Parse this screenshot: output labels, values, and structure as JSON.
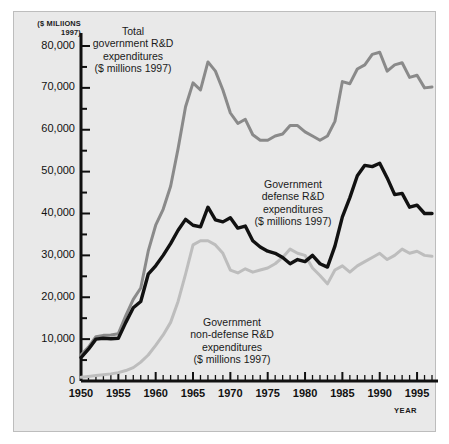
{
  "figure": {
    "background": "#ffffff",
    "panel_background": "#e9e9e9",
    "panel_border": "#bdbdbd"
  },
  "axis": {
    "y_header": "($ MILlIONS\n1997)",
    "x_label": "YEAR",
    "y_ticks": [
      "80,000",
      "70,000",
      "60,000",
      "50,000",
      "40,000",
      "30,000",
      "20,000",
      "10,000",
      "0"
    ],
    "x_ticks": [
      "1950",
      "1955",
      "1960",
      "1965",
      "1970",
      "1975",
      "1980",
      "1985",
      "1990",
      "1995"
    ]
  },
  "annotations": {
    "total": "Total\ngovernment R&D\nexpenditures\n($ millions 1997)",
    "defense": "Government\ndefense R&D\nexpenditures\n($ millions 1997)",
    "nondefense": "Government\nnon-defense R&D\nexpenditures\n($ millions 1997)"
  },
  "chart_data": {
    "type": "line",
    "title": "",
    "xlabel": "YEAR",
    "ylabel": "($ MILlIONS 1997)",
    "xlim": [
      1950,
      1997
    ],
    "ylim": [
      0,
      80000
    ],
    "grid": false,
    "legend_position": "inline-annotations",
    "y_tick_values": [
      0,
      10000,
      20000,
      30000,
      40000,
      50000,
      60000,
      70000,
      80000
    ],
    "y_minor_tick_step": 5000,
    "x_tick_values": [
      1950,
      1955,
      1960,
      1965,
      1970,
      1975,
      1980,
      1985,
      1990,
      1995
    ],
    "x_minor_tick_step": 1,
    "x": [
      1950,
      1951,
      1952,
      1953,
      1954,
      1955,
      1956,
      1957,
      1958,
      1959,
      1960,
      1961,
      1962,
      1963,
      1964,
      1965,
      1966,
      1967,
      1968,
      1969,
      1970,
      1971,
      1972,
      1973,
      1974,
      1975,
      1976,
      1977,
      1978,
      1979,
      1980,
      1981,
      1982,
      1983,
      1984,
      1985,
      1986,
      1987,
      1988,
      1989,
      1990,
      1991,
      1992,
      1993,
      1994,
      1995,
      1996,
      1997
    ],
    "series": [
      {
        "name": "Total government R&D expenditures ($ millions 1997)",
        "color": "#8a8a8a",
        "width": 3,
        "values": [
          6200,
          8100,
          10600,
          10900,
          11000,
          11300,
          15600,
          19500,
          22200,
          31000,
          37200,
          41000,
          46500,
          55500,
          65500,
          71200,
          69500,
          76200,
          74000,
          69500,
          64000,
          61500,
          62500,
          58800,
          57500,
          57500,
          58500,
          59000,
          61000,
          61000,
          59500,
          58500,
          57500,
          58500,
          62000,
          71500,
          71000,
          74500,
          75500,
          78000,
          78500,
          74000,
          75500,
          76000,
          72500,
          73000,
          70000,
          70200
        ]
      },
      {
        "name": "Government defense R&D expenditures ($ millions 1997)",
        "color": "#111111",
        "width": 3.4,
        "values": [
          5600,
          7600,
          10000,
          10200,
          10100,
          10200,
          14000,
          17500,
          19000,
          25500,
          27500,
          30000,
          32800,
          36000,
          38600,
          37200,
          36800,
          41500,
          38500,
          38000,
          39000,
          36500,
          37000,
          33500,
          32000,
          31000,
          30500,
          29500,
          28000,
          29000,
          28500,
          30000,
          28000,
          27200,
          32200,
          39200,
          43800,
          49000,
          51500,
          51200,
          52000,
          48500,
          44500,
          44800,
          41500,
          42000,
          40000,
          40000
        ]
      },
      {
        "name": "Government non-defense R&D expenditures ($ millions 1997)",
        "color": "#bdbdbd",
        "width": 3,
        "values": [
          900,
          1100,
          1300,
          1500,
          1700,
          2000,
          2500,
          3200,
          4500,
          6200,
          8500,
          11000,
          14000,
          19000,
          25500,
          32500,
          33500,
          33500,
          32500,
          30500,
          26500,
          25800,
          26800,
          26000,
          26500,
          27000,
          28000,
          29500,
          31500,
          30500,
          30000,
          27000,
          25200,
          23200,
          26500,
          27500,
          26000,
          27500,
          28500,
          29500,
          30500,
          29000,
          30000,
          31500,
          30500,
          31000,
          30000,
          29800
        ]
      }
    ]
  }
}
